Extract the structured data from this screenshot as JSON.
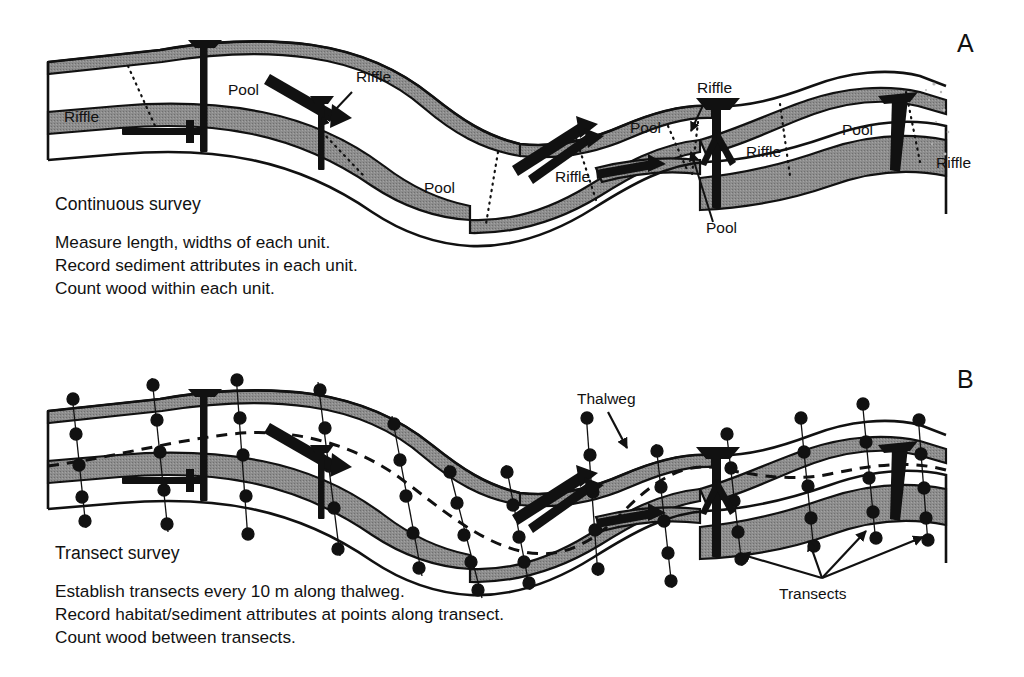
{
  "figure": {
    "background": "#ffffff",
    "ink": "#111111",
    "bar_fill": "#8a8a8a",
    "water_fill": "#ffffff"
  },
  "panels": [
    {
      "id": "A",
      "letter": "A",
      "letter_pos": [
        957,
        52
      ],
      "survey_title": "Continuous survey",
      "survey_title_pos": [
        55,
        210
      ],
      "caption_lines": [
        "Measure length, widths of each unit.",
        "Record sediment attributes in each unit.",
        "Count wood within each unit."
      ],
      "caption_pos": [
        55,
        248
      ],
      "unit_labels": [
        {
          "text": "Riffle",
          "x": 64,
          "y": 122,
          "leader": false
        },
        {
          "text": "Pool",
          "x": 228,
          "y": 95,
          "leader": false
        },
        {
          "text": "Riffle",
          "x": 356,
          "y": 82,
          "leader": true,
          "arrow": [
            [
              352,
              90
            ],
            [
              318,
              128
            ]
          ]
        },
        {
          "text": "Pool",
          "x": 424,
          "y": 193,
          "leader": false
        },
        {
          "text": "Riffle",
          "x": 555,
          "y": 182,
          "leader": false
        },
        {
          "text": "Pool",
          "x": 630,
          "y": 133,
          "leader": false
        },
        {
          "text": "Riffle",
          "x": 697,
          "y": 93,
          "leader": true,
          "arrow": [
            [
              703,
              101
            ],
            [
              690,
              133
            ]
          ]
        },
        {
          "text": "Riffle",
          "x": 746,
          "y": 157,
          "leader": false
        },
        {
          "text": "Pool",
          "x": 706,
          "y": 233,
          "leader": true,
          "arrow": [
            [
              713,
              222
            ],
            [
              690,
              150
            ]
          ]
        },
        {
          "text": "Pool",
          "x": 842,
          "y": 135,
          "leader": false
        },
        {
          "text": "Riffle",
          "x": 936,
          "y": 168,
          "leader": false
        }
      ]
    },
    {
      "id": "B",
      "letter": "B",
      "letter_pos": [
        957,
        388
      ],
      "survey_title": "Transect survey",
      "survey_title_pos": [
        55,
        559
      ],
      "caption_lines": [
        "Establish transects every 10 m along thalweg.",
        "Record habitat/sediment attributes at points along transect.",
        "Count wood between transects."
      ],
      "caption_pos": [
        55,
        597
      ],
      "annotations": [
        {
          "text": "Thalweg",
          "x": 577,
          "y": 404,
          "arrow": [
            [
              608,
              412
            ],
            [
              626,
              447
            ]
          ]
        },
        {
          "text": "Transects",
          "x": 779,
          "y": 599,
          "arrow_origin": [
            822,
            578
          ],
          "arrow_tips": [
            [
              738,
              553
            ],
            [
              808,
              540
            ],
            [
              865,
              530
            ],
            [
              922,
              536
            ]
          ]
        }
      ]
    }
  ],
  "legend_terms": {
    "riffle": "Riffle",
    "pool": "Pool",
    "thalweg": "Thalweg",
    "transects": "Transects"
  }
}
